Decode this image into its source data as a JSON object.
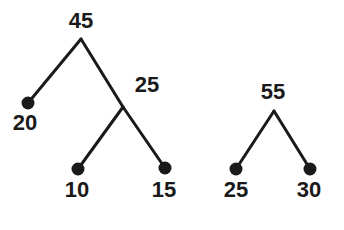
{
  "figure": {
    "kind": "binary-tree-diagram",
    "background_color": "#ffffff",
    "stroke_color": "#1a1a1a",
    "text_color": "#1a1a1a",
    "edge_width": 3,
    "leaf_dot_radius": 6.5,
    "width": 344,
    "height": 230
  },
  "trees": [
    {
      "name": "left-tree",
      "root_label": "45",
      "nodes": [
        {
          "id": "n45",
          "label": "45",
          "role": "internal",
          "x": 81,
          "y": 39,
          "label_x": 81,
          "label_y": 21,
          "dot": false
        },
        {
          "id": "n20",
          "label": "20",
          "role": "leaf",
          "x": 28,
          "y": 103,
          "label_x": 25,
          "label_y": 123,
          "dot": true
        },
        {
          "id": "n25",
          "label": "25",
          "role": "internal",
          "x": 123,
          "y": 107,
          "label_x": 147,
          "label_y": 85,
          "dot": false
        },
        {
          "id": "n10",
          "label": "10",
          "role": "leaf",
          "x": 78,
          "y": 169,
          "label_x": 77,
          "label_y": 190,
          "dot": true
        },
        {
          "id": "n15",
          "label": "15",
          "role": "leaf",
          "x": 165,
          "y": 168,
          "label_x": 164,
          "label_y": 190,
          "dot": true
        }
      ],
      "edges": [
        {
          "from": "n45",
          "to": "n20",
          "x1": 81,
          "y1": 39,
          "x2": 28,
          "y2": 103
        },
        {
          "from": "n45",
          "to": "n25",
          "x1": 81,
          "y1": 39,
          "x2": 123,
          "y2": 107
        },
        {
          "from": "n25",
          "to": "n10",
          "x1": 123,
          "y1": 107,
          "x2": 78,
          "y2": 169
        },
        {
          "from": "n25",
          "to": "n15",
          "x1": 123,
          "y1": 107,
          "x2": 165,
          "y2": 168
        }
      ]
    },
    {
      "name": "right-tree",
      "root_label": "55",
      "nodes": [
        {
          "id": "n55",
          "label": "55",
          "role": "internal",
          "x": 274,
          "y": 111,
          "label_x": 273,
          "label_y": 92,
          "dot": false
        },
        {
          "id": "n25r",
          "label": "25",
          "role": "leaf",
          "x": 236,
          "y": 169,
          "label_x": 236,
          "label_y": 190,
          "dot": true
        },
        {
          "id": "n30",
          "label": "30",
          "role": "leaf",
          "x": 310,
          "y": 169,
          "label_x": 309,
          "label_y": 190,
          "dot": true
        }
      ],
      "edges": [
        {
          "from": "n55",
          "to": "n25r",
          "x1": 274,
          "y1": 111,
          "x2": 236,
          "y2": 169
        },
        {
          "from": "n55",
          "to": "n30",
          "x1": 274,
          "y1": 111,
          "x2": 310,
          "y2": 169
        }
      ]
    }
  ]
}
